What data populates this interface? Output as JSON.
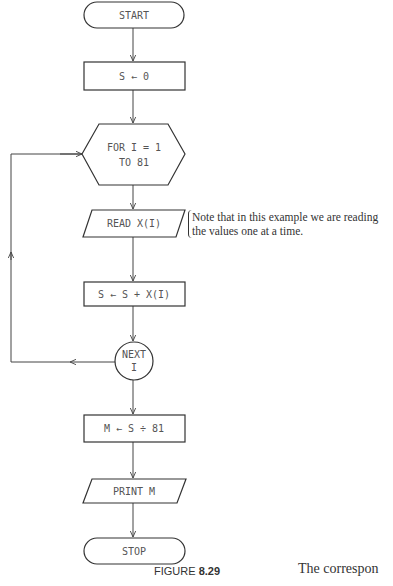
{
  "flowchart": {
    "start": "START",
    "init": "S ← 0",
    "loop_line1": "FOR I = 1",
    "loop_line2": "TO 81",
    "read": "READ X(I)",
    "accumulate": "S ← S + X(I)",
    "next_line1": "NEXT",
    "next_line2": "I",
    "compute_mean": "M ← S ÷ 81",
    "print": "PRINT M",
    "stop": "STOP"
  },
  "note": {
    "line1": "Note that in this example we are reading",
    "line2": "the values one at a time."
  },
  "caption": {
    "prefix": "FIGURE ",
    "number": "8.29"
  },
  "body_text": "The correspon"
}
